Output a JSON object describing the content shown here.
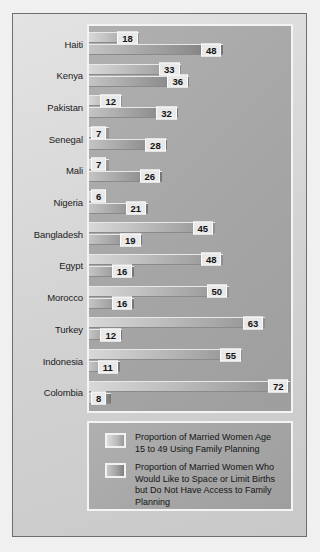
{
  "chart_data": {
    "type": "bar",
    "orientation": "horizontal",
    "title": "",
    "xlabel": "",
    "ylabel": "",
    "xlim": [
      0,
      75
    ],
    "grid": false,
    "legend_position": "bottom",
    "categories": [
      "Haiti",
      "Kenya",
      "Pakistan",
      "Senegal",
      "Mali",
      "Nigeria",
      "Bangladesh",
      "Egypt",
      "Morocco",
      "Turkey",
      "Indonesia",
      "Colombia"
    ],
    "series": [
      {
        "name": "Proportion of Married Women Age 15 to 49 Using Family Planning",
        "values": [
          18,
          33,
          12,
          7,
          7,
          6,
          45,
          48,
          50,
          63,
          55,
          72
        ]
      },
      {
        "name": "Proportion of Married Women Who Would Like to Space or Limit Births but Do Not Have Access to Family Planning",
        "values": [
          48,
          36,
          32,
          28,
          26,
          21,
          19,
          16,
          16,
          12,
          11,
          8
        ]
      }
    ]
  },
  "legend": {
    "items": [
      {
        "label": "Proportion of Married Women Age 15 to 49 Using Family Planning",
        "swatch": "gradient-light"
      },
      {
        "label": "Proportion of Married Women Who Would Like to Space or Limit Births but Do Not Have Access to Family Planning",
        "swatch": "gradient-dark"
      }
    ]
  },
  "colors": {
    "panel_background": "#a6a6a6",
    "page_background": "#d8d8d8",
    "series_1_start": "#d8d8d8",
    "series_1_end": "#8f8f8f",
    "series_2_start": "#c4c4c4",
    "series_2_end": "#757575",
    "label_text": "#141414",
    "panel_border": "#f4f4f4"
  }
}
